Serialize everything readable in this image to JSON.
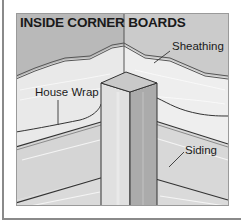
{
  "figure": {
    "title": "INSIDE CORNER BOARDS",
    "labels": {
      "sheathing": "Sheathing",
      "house_wrap": "House Wrap",
      "siding": "Siding"
    },
    "colors": {
      "wall_dark": "#b4b4b4",
      "wall_light": "#e4e4e4",
      "sheathing": "#ededed",
      "siding": "#d6d6d6",
      "post_front": "#dedede",
      "post_side": "#a9a9a9",
      "post_top": "#c8c8c8",
      "line": "#3a3a3a",
      "frame": "#8a8a8a"
    }
  }
}
